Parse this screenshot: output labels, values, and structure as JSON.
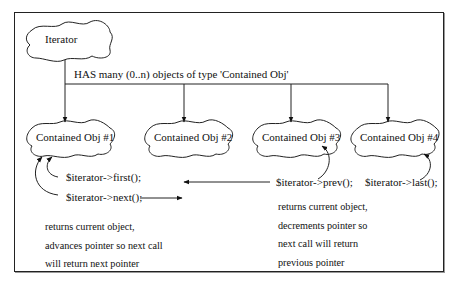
{
  "diagram": {
    "iterator_label": "Iterator",
    "relation_label": "HAS many (0..n) objects of type 'Contained Obj'",
    "objects": [
      {
        "label": "Contained Obj #1"
      },
      {
        "label": "Contained Obj #2"
      },
      {
        "label": "Contained Obj #3"
      },
      {
        "label": "Contained Obj #4"
      }
    ],
    "methods": {
      "first": "$iterator->first();",
      "next": "$iterator->next();",
      "prev": "$iterator->prev();",
      "last": "$iterator->last();"
    },
    "notes": {
      "next": [
        "returns current object,",
        "advances pointer so next call",
        "will return next pointer"
      ],
      "prev": [
        "returns current object,",
        "decrements pointer so",
        "next call will return",
        "previous pointer"
      ]
    }
  }
}
